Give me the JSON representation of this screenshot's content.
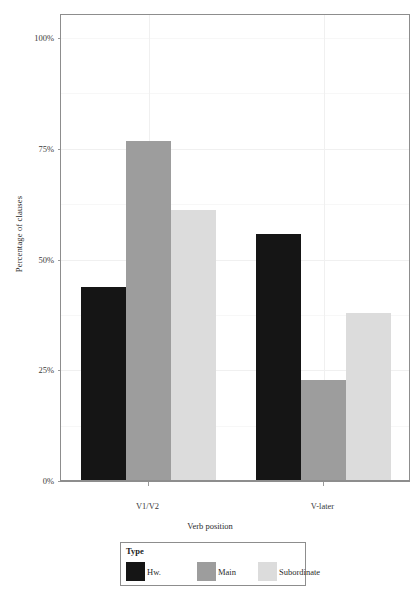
{
  "chart_data": {
    "type": "bar",
    "title": "",
    "subtitle": "",
    "xlabel": "Verb position",
    "ylabel": "Percentage of clauses",
    "categories": [
      "V1/V2",
      "V-later"
    ],
    "series": [
      {
        "name": "Hw.",
        "color": "#151515",
        "values": [
          43.5,
          55.5
        ]
      },
      {
        "name": "Main",
        "color": "#9d9d9d",
        "values": [
          76.5,
          22.5
        ]
      },
      {
        "name": "Subordinate",
        "color": "#dcdcdc",
        "values": [
          61.0,
          37.7
        ]
      }
    ],
    "legend_title": "Type",
    "legend_position": "bottom",
    "ylim": [
      0,
      107
    ],
    "yticks": [
      {
        "value": 0,
        "label": "0%"
      },
      {
        "value": 25,
        "label": "25%"
      },
      {
        "value": 50,
        "label": "50%"
      },
      {
        "value": 75,
        "label": "75%"
      },
      {
        "value": 100,
        "label": "100%"
      }
    ],
    "grid": true,
    "grid_major_color": "#f0f0f0",
    "grid_minor_color": "#f7f7f7",
    "panel_border_color": "#8d8d8d",
    "caption": ""
  }
}
